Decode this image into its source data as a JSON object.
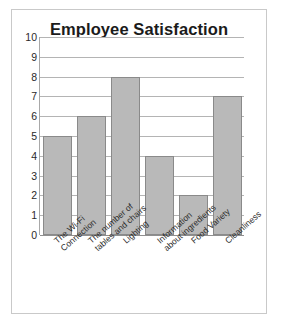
{
  "chart_data": {
    "type": "bar",
    "title": "Employee Satisfaction",
    "xlabel": "",
    "ylabel": "",
    "ylim": [
      0,
      10
    ],
    "ytick_step": 1,
    "yticks": [
      "10",
      "9",
      "8",
      "7",
      "6",
      "5",
      "4",
      "3",
      "2",
      "1",
      "0"
    ],
    "grid": true,
    "legend": "none",
    "categories": [
      "The Wi-Fi\nConnection",
      "The number of\ntables and chairs",
      "Lighting",
      "Information\nabout ingredients",
      "Food Variety",
      "Cleanliness"
    ],
    "category_lines": [
      [
        "The Wi-Fi",
        "Connection"
      ],
      [
        "The number of",
        "tables and chairs"
      ],
      [
        "Lighting"
      ],
      [
        "Information",
        "about ingredients"
      ],
      [
        "Food Variety"
      ],
      [
        "Cleanliness"
      ]
    ],
    "values": [
      5,
      6,
      8,
      4,
      2,
      7
    ],
    "bar_color": "#b9b9b9",
    "bar_border_color": "#8a8a8a",
    "gridline_color": "#b4b4b4",
    "axis_color": "#a8a8a8",
    "title_color": "#1b1b1b",
    "background": "#ffffff",
    "frame_color": "#c9c9c9"
  }
}
